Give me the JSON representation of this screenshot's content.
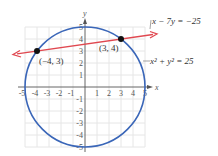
{
  "figure": {
    "type": "diagram",
    "axes": {
      "x_label": "x",
      "y_label": "y",
      "x_ticks": [
        "-5",
        "-4",
        "-3",
        "-2",
        "-1",
        "1",
        "2",
        "3",
        "4",
        "5"
      ],
      "y_ticks": [
        "5",
        "4",
        "3",
        "2",
        "1",
        "-1",
        "-2",
        "-3",
        "-4",
        "-5"
      ],
      "range": [
        -5,
        5
      ]
    },
    "circle": {
      "equation": "x² + y² = 25",
      "color": "#3a66b8",
      "center": [
        0,
        0
      ],
      "radius": 5
    },
    "line": {
      "equation": "x − 7y = −25",
      "color": "#e04850"
    },
    "points": [
      {
        "label": "(−4, 3)",
        "x": -4,
        "y": 3
      },
      {
        "label": "(3, 4)",
        "x": 3,
        "y": 4
      }
    ],
    "colors": {
      "grid": "#e6e6e6",
      "axis": "#555555",
      "point": "#111111"
    }
  }
}
